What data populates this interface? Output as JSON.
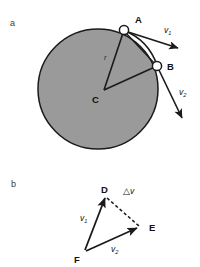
{
  "figure": {
    "background_color": "#ffffff",
    "stroke_color": "#1a1a1a",
    "disk_fill_color": "#9a9a9a",
    "panels": [
      {
        "id": "panel-a",
        "label": "a",
        "label_pos": [
          14,
          26
        ],
        "description": "Rotating disk with radius r, points A and B on rim, center C, velocity vectors v1 and v2 tangent to the rim",
        "disk": {
          "cx": 98,
          "cy": 89,
          "r": 60
        },
        "points": [
          {
            "name": "A",
            "label": "A",
            "x": 124,
            "y": 30,
            "label_x": 136,
            "label_y": 24,
            "marker": "open-circle"
          },
          {
            "name": "B",
            "label": "B",
            "x": 157,
            "y": 66,
            "label_x": 168,
            "label_y": 70,
            "marker": "open-circle"
          },
          {
            "name": "C",
            "label": "C",
            "x": 104,
            "y": 90,
            "label_x": 93,
            "label_y": 102,
            "marker": "none"
          }
        ],
        "radius_label": {
          "text": "r",
          "x": 104,
          "y": 60
        },
        "vectors": [
          {
            "name": "v1",
            "label": "v",
            "subscript": "1",
            "from": [
              124,
              30
            ],
            "to": [
              181,
              49
            ],
            "label_x": 164,
            "label_y": 33
          },
          {
            "name": "v2",
            "label": "v",
            "subscript": "2",
            "from": [
              157,
              66
            ],
            "to": [
              184,
              122
            ],
            "label_x": 180,
            "label_y": 95
          }
        ]
      },
      {
        "id": "panel-b",
        "label": "b",
        "label_pos": [
          15,
          186
        ],
        "description": "Vector triangle D-E-F showing v1, v2 and the change in velocity delta-v",
        "points": [
          {
            "name": "D",
            "label": "D",
            "x": 106,
            "y": 196,
            "label_x": 103,
            "label_y": 192
          },
          {
            "name": "E",
            "label": "E",
            "x": 140,
            "y": 227,
            "label_x": 150,
            "label_y": 228
          },
          {
            "name": "F",
            "label": "F",
            "x": 85,
            "y": 252,
            "label_x": 77,
            "label_y": 262
          }
        ],
        "edges": [
          {
            "name": "v1-edge",
            "from": "F",
            "to": "D",
            "style": "solid-arrow"
          },
          {
            "name": "v2-edge",
            "from": "F",
            "to": "E",
            "style": "solid-arrow"
          },
          {
            "name": "delta-v-edge",
            "from": "D",
            "to": "E",
            "style": "dashed"
          }
        ],
        "vectors": [
          {
            "name": "v1",
            "label": "v",
            "subscript": "1",
            "label_x": 83,
            "label_y": 221
          },
          {
            "name": "v2",
            "label": "v",
            "subscript": "2",
            "label_x": 114,
            "label_y": 251
          }
        ],
        "delta_label": {
          "name": "delta-v",
          "text": "△",
          "italic_text": "v",
          "x": 127,
          "y": 193
        }
      }
    ]
  }
}
